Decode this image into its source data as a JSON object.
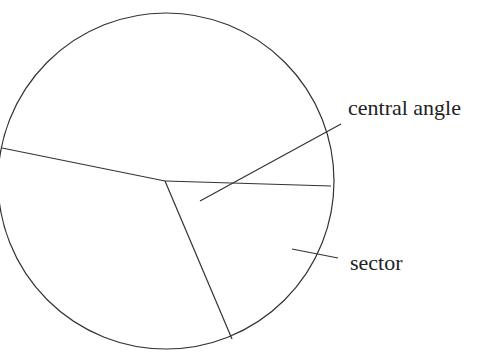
{
  "diagram": {
    "labels": {
      "central_angle": "central angle",
      "sector": "sector"
    },
    "circle": {
      "cx": 166,
      "cy": 181,
      "r": 168
    },
    "center": {
      "x": 165,
      "y": 181
    },
    "radii": [
      {
        "name": "left-radius",
        "x2": 2,
        "y2": 148
      },
      {
        "name": "right-radius",
        "x2": 331,
        "y2": 186
      },
      {
        "name": "bottom-radius",
        "x2": 232,
        "y2": 339
      }
    ],
    "leaders": {
      "central_angle": {
        "x1": 200,
        "y1": 201,
        "x2": 341,
        "y2": 124
      },
      "sector": {
        "x1": 292,
        "y1": 249,
        "x2": 338,
        "y2": 258
      }
    },
    "colors": {
      "stroke": "#333333",
      "text": "#222222",
      "background": "#ffffff"
    }
  }
}
